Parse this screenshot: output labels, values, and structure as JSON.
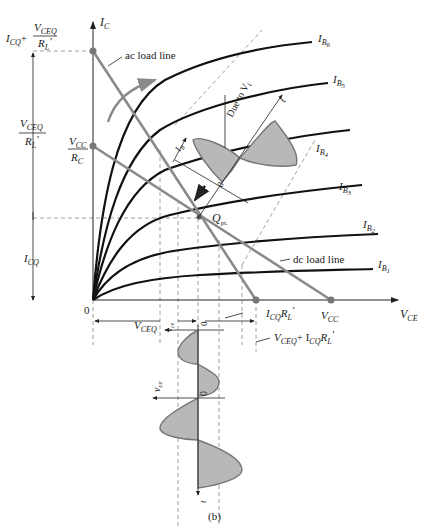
{
  "diagram": {
    "caption": "(b)",
    "axes": {
      "y_label_main": "I",
      "y_label_sub": "C",
      "x_label_main": "V",
      "x_label_sub": "CE",
      "origin": "0"
    },
    "curves": [
      {
        "label_main": "I",
        "label_sub": "B",
        "label_subsub": "6"
      },
      {
        "label_main": "I",
        "label_sub": "B",
        "label_subsub": "5"
      },
      {
        "label_main": "I",
        "label_sub": "B",
        "label_subsub": "4"
      },
      {
        "label_main": "I",
        "label_sub": "B",
        "label_subsub": "3"
      },
      {
        "label_main": "I",
        "label_sub": "B",
        "label_subsub": "2"
      },
      {
        "label_main": "I",
        "label_sub": "B",
        "label_subsub": "1"
      }
    ],
    "annotations": {
      "ac_load_line": "ac load line",
      "dc_load_line": "dc load line",
      "q_point_main": "Q",
      "q_point_sub": "pt.",
      "due_to": "Due to V",
      "due_to_sub": "i",
      "ib_main": "I",
      "ib_sub": "B",
      "zero": "0",
      "t": "t"
    },
    "y_labels": {
      "top_icq": "I",
      "top_icq_sub": "CQ",
      "top_plus": "+",
      "top_num": "V",
      "top_num_sub": "CEQ",
      "top_den": "R",
      "top_den_sub": "L",
      "top_den_prime": "′",
      "mid_num": "V",
      "mid_num_sub": "CEQ",
      "mid_den": "R",
      "mid_den_sub": "L",
      "mid_den_prime": "′",
      "vcc_num": "V",
      "vcc_num_sub": "CC",
      "vcc_den": "R",
      "vcc_den_sub": "C",
      "icq": "I",
      "icq_sub": "CQ"
    },
    "x_labels": {
      "vceq": "V",
      "vceq_sub": "CEQ",
      "vce": "v",
      "vce_sub": "ce",
      "icq_rl": "I",
      "icq_rl_sub": "CQ",
      "icq_rl_r": "R",
      "icq_rl_r_sub": "L",
      "icq_rl_prime": "′",
      "vcc": "V",
      "vcc_sub": "CC",
      "sum_text": "V",
      "sum_sub": "CEQ",
      "sum_plus": "+ I",
      "sum_sub2": "CQ",
      "sum_r": "R",
      "sum_r_sub": "L",
      "sum_prime": "′"
    }
  }
}
